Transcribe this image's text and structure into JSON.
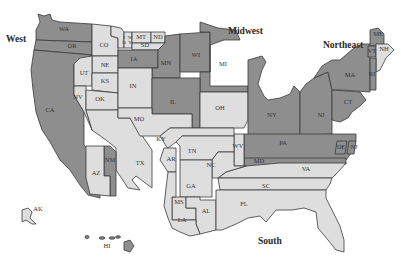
{
  "map": {
    "title": "United States Regions",
    "colors": {
      "dark": "#8e8e8e",
      "light": "#dedede",
      "border": "#3a3a3a",
      "background": "#ffffff"
    },
    "regions": [
      {
        "label": "West",
        "x": 6,
        "y": 42
      },
      {
        "label": "Midwest",
        "x": 228,
        "y": 34
      },
      {
        "label": "Northeast",
        "x": 323,
        "y": 48
      },
      {
        "label": "South",
        "x": 258,
        "y": 244
      }
    ],
    "states": [
      {
        "abbr": "WA",
        "shade": "dark",
        "x": 64,
        "y": 30
      },
      {
        "abbr": "OR",
        "shade": "dark",
        "x": 72,
        "y": 47
      },
      {
        "abbr": "CA",
        "shade": "dark",
        "x": 50,
        "y": 111
      },
      {
        "abbr": "CO",
        "shade": "light",
        "x": 104,
        "y": 46
      },
      {
        "abbr": "ID",
        "shade": "light",
        "x": 124,
        "y": 40
      },
      {
        "abbr": "WY",
        "shade": "light",
        "x": 130,
        "y": 40
      },
      {
        "abbr": "MT",
        "shade": "light",
        "x": 141,
        "y": 38
      },
      {
        "abbr": "ND",
        "shade": "light",
        "x": 158,
        "y": 38
      },
      {
        "abbr": "SD",
        "shade": "light",
        "x": 145,
        "y": 46
      },
      {
        "abbr": "NE",
        "shade": "light",
        "x": 105,
        "y": 66
      },
      {
        "abbr": "UT",
        "shade": "light",
        "x": 84,
        "y": 74
      },
      {
        "abbr": "KS",
        "shade": "light",
        "x": 105,
        "y": 82
      },
      {
        "abbr": "NV",
        "shade": "light",
        "x": 78,
        "y": 98
      },
      {
        "abbr": "OK",
        "shade": "light",
        "x": 100,
        "y": 100
      },
      {
        "abbr": "IA",
        "shade": "dark",
        "x": 134,
        "y": 60
      },
      {
        "abbr": "MN",
        "shade": "dark",
        "x": 166,
        "y": 64
      },
      {
        "abbr": "WI",
        "shade": "dark",
        "x": 196,
        "y": 56
      },
      {
        "abbr": "MI",
        "shade": "dark",
        "x": 223,
        "y": 65
      },
      {
        "abbr": "IN",
        "shade": "light",
        "x": 133,
        "y": 87
      },
      {
        "abbr": "IL",
        "shade": "dark",
        "x": 173,
        "y": 103
      },
      {
        "abbr": "OH",
        "shade": "light",
        "x": 220,
        "y": 109
      },
      {
        "abbr": "MO",
        "shade": "light",
        "x": 139,
        "y": 120
      },
      {
        "abbr": "NY",
        "shade": "dark",
        "x": 272,
        "y": 116
      },
      {
        "abbr": "NJ",
        "shade": "dark",
        "x": 321,
        "y": 116
      },
      {
        "abbr": "PA",
        "shade": "dark",
        "x": 283,
        "y": 144
      },
      {
        "abbr": "MA",
        "shade": "dark",
        "x": 350,
        "y": 76
      },
      {
        "abbr": "CT",
        "shade": "dark",
        "x": 348,
        "y": 103
      },
      {
        "abbr": "ME",
        "shade": "dark",
        "x": 378,
        "y": 35
      },
      {
        "abbr": "VT",
        "shade": "dark",
        "x": 372,
        "y": 52
      },
      {
        "abbr": "NH",
        "shade": "light",
        "x": 384,
        "y": 50
      },
      {
        "abbr": "RI",
        "shade": "dark",
        "x": 372,
        "y": 75
      },
      {
        "abbr": "DE",
        "shade": "dark",
        "x": 341,
        "y": 148
      },
      {
        "abbr": "NJ2",
        "shade": "dark",
        "x": 354,
        "y": 148
      },
      {
        "abbr": "MD",
        "shade": "dark",
        "x": 259,
        "y": 162
      },
      {
        "abbr": "WV",
        "shade": "light",
        "x": 238,
        "y": 147
      },
      {
        "abbr": "VA",
        "shade": "light",
        "x": 306,
        "y": 170
      },
      {
        "abbr": "KY",
        "shade": "light",
        "x": 161,
        "y": 140
      },
      {
        "abbr": "TN",
        "shade": "light",
        "x": 192,
        "y": 152
      },
      {
        "abbr": "AR",
        "shade": "light",
        "x": 171,
        "y": 160
      },
      {
        "abbr": "NC",
        "shade": "light",
        "x": 211,
        "y": 166
      },
      {
        "abbr": "TX",
        "shade": "light",
        "x": 140,
        "y": 164
      },
      {
        "abbr": "NM",
        "shade": "dark",
        "x": 110,
        "y": 161
      },
      {
        "abbr": "AZ",
        "shade": "light",
        "x": 96,
        "y": 174
      },
      {
        "abbr": "GA",
        "shade": "light",
        "x": 191,
        "y": 187
      },
      {
        "abbr": "SC",
        "shade": "light",
        "x": 266,
        "y": 187
      },
      {
        "abbr": "MS",
        "shade": "light",
        "x": 179,
        "y": 203
      },
      {
        "abbr": "AL",
        "shade": "light",
        "x": 206,
        "y": 212
      },
      {
        "abbr": "LA",
        "shade": "light",
        "x": 182,
        "y": 221
      },
      {
        "abbr": "FL",
        "shade": "light",
        "x": 244,
        "y": 205
      },
      {
        "abbr": "AK",
        "shade": "light",
        "x": 38,
        "y": 210
      },
      {
        "abbr": "HI",
        "shade": "light",
        "x": 107,
        "y": 247
      }
    ],
    "state_labels": {
      "WA": "WA",
      "OR": "OR",
      "CA": "CA",
      "CO": "CO",
      "ID": "I\nD",
      "WY": "W\nY",
      "MT": "MT",
      "ND": "ND",
      "SD": "SD",
      "NE": "NE",
      "UT": "UT",
      "KS": "KS",
      "NV": "NV",
      "OK": "OK",
      "IA": "IA",
      "MN": "MN",
      "WI": "WI",
      "MI": "MI",
      "IN": "IN",
      "IL": "IL",
      "OH": "OH",
      "MO": "MO",
      "NY": "NY",
      "NJ": "NJ",
      "PA": "PA",
      "MA": "MA",
      "CT": "CT",
      "ME": "ME",
      "VT": "VT",
      "NH": "NH",
      "RI": "RI",
      "DE": "DE",
      "MD": "MD",
      "WV": "WV",
      "VA": "VA",
      "KY": "KY",
      "TN": "TN",
      "AR": "AR",
      "NC": "NC",
      "TX": "TX",
      "NM": "NM",
      "AZ": "AZ",
      "GA": "GA",
      "SC": "SC",
      "MS": "MS",
      "AL": "AL",
      "LA": "LA",
      "FL": "FL",
      "AK": "AK",
      "HI": "HI"
    }
  }
}
